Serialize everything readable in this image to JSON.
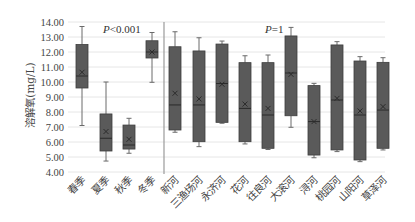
{
  "chart_data": {
    "type": "box",
    "title": "",
    "xlabel": "",
    "ylabel": "溶解氧(mg/L)",
    "ylim": [
      4.0,
      14.0
    ],
    "yticks": [
      "4.00",
      "5.00",
      "6.00",
      "7.00",
      "8.00",
      "9.00",
      "10.00",
      "11.00",
      "12.00",
      "13.00",
      "14.00"
    ],
    "grid": true,
    "groups": [
      {
        "name": "seasons",
        "annotation": {
          "prefix": "P",
          "text": "<0.001"
        },
        "categories": [
          "春季",
          "夏季",
          "秋季",
          "冬季"
        ],
        "boxes": [
          {
            "label": "春季",
            "min": 7.1,
            "q1": 9.6,
            "median": 10.4,
            "mean": 10.65,
            "q3": 12.5,
            "max": 13.7
          },
          {
            "label": "夏季",
            "min": 4.73,
            "q1": 5.4,
            "median": 6.25,
            "mean": 6.7,
            "q3": 7.87,
            "max": 10.0
          },
          {
            "label": "秋季",
            "min": 5.25,
            "q1": 5.53,
            "median": 5.8,
            "mean": 6.18,
            "q3": 7.13,
            "max": 7.58
          },
          {
            "label": "冬季",
            "min": 9.98,
            "q1": 11.6,
            "median": 12.0,
            "mean": 12.0,
            "q3": 12.75,
            "max": 13.3
          }
        ]
      },
      {
        "name": "rivers",
        "annotation": {
          "prefix": "P",
          "text": "=1"
        },
        "categories": [
          "新河",
          "三渔场河",
          "永济河",
          "花河",
          "往良河",
          "大滚河",
          "浔河",
          "桃园河",
          "山阳河",
          "草泽河"
        ],
        "boxes": [
          {
            "label": "新河",
            "min": 6.65,
            "q1": 6.8,
            "median": 8.47,
            "mean": 9.25,
            "q3": 12.35,
            "max": 13.35
          },
          {
            "label": "三渔场河",
            "min": 5.69,
            "q1": 6.02,
            "median": 8.47,
            "mean": 8.87,
            "q3": 12.07,
            "max": 12.95
          },
          {
            "label": "永济河",
            "min": 7.25,
            "q1": 7.31,
            "median": 9.9,
            "mean": 9.85,
            "q3": 12.53,
            "max": 12.73
          },
          {
            "label": "花河",
            "min": 5.87,
            "q1": 6.02,
            "median": 8.24,
            "mean": 8.53,
            "q3": 11.29,
            "max": 11.75
          },
          {
            "label": "往良河",
            "min": 5.5,
            "q1": 5.58,
            "median": 7.8,
            "mean": 8.24,
            "q3": 11.29,
            "max": 11.8
          },
          {
            "label": "大滚河",
            "min": 6.98,
            "q1": 7.75,
            "median": 10.6,
            "mean": 10.51,
            "q3": 13.07,
            "max": 13.64
          },
          {
            "label": "浔河",
            "min": 4.95,
            "q1": 5.13,
            "median": 7.36,
            "mean": 7.36,
            "q3": 9.76,
            "max": 9.91
          },
          {
            "label": "桃园河",
            "min": 5.36,
            "q1": 5.47,
            "median": 8.8,
            "mean": 8.91,
            "q3": 12.47,
            "max": 12.69
          },
          {
            "label": "山阳河",
            "min": 4.69,
            "q1": 4.8,
            "median": 7.8,
            "mean": 8.07,
            "q3": 11.4,
            "max": 11.69
          },
          {
            "label": "草泽河",
            "min": 5.47,
            "q1": 5.58,
            "median": 8.13,
            "mean": 8.36,
            "q3": 11.31,
            "max": 11.62
          }
        ]
      }
    ],
    "colors": {
      "box": "#5a5a5a",
      "grid": "#e6e6e6",
      "divider": "#9a9a9a"
    }
  }
}
